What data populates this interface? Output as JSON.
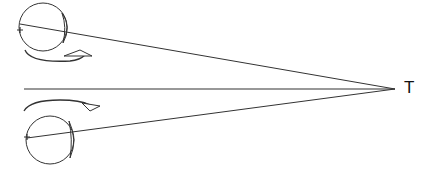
{
  "diagram": {
    "target_label": "T",
    "stroke_color": "#333333",
    "background": "#ffffff",
    "elements": {
      "top_eye": {
        "cx": 43,
        "cy": 27,
        "r": 24,
        "rotation_arrow": "clockwise-toward-target"
      },
      "bottom_eye": {
        "cx": 50,
        "cy": 140,
        "r": 24,
        "rotation_arrow": "toward-target"
      },
      "target_point": {
        "x": 395,
        "y": 89
      },
      "midline": {
        "x1": 24,
        "y1": 89,
        "x2": 395,
        "y2": 89
      }
    }
  }
}
